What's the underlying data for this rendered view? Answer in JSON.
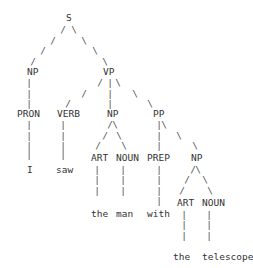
{
  "sentence": [
    "I",
    "saw",
    "the",
    "man",
    "with",
    "the",
    "telescope"
  ],
  "nodes": [
    {
      "id": "S",
      "label": "S",
      "x": 66,
      "y": 18,
      "kind": "phrase"
    },
    {
      "id": "NP1",
      "label": "NP",
      "x": 27,
      "y": 72,
      "kind": "phrase"
    },
    {
      "id": "VP",
      "label": "VP",
      "x": 103,
      "y": 72,
      "kind": "phrase"
    },
    {
      "id": "PRON",
      "label": "PRON",
      "x": 17,
      "y": 114,
      "kind": "pos"
    },
    {
      "id": "VERB",
      "label": "VERB",
      "x": 57,
      "y": 114,
      "kind": "pos"
    },
    {
      "id": "NP2",
      "label": "NP",
      "x": 107,
      "y": 114,
      "kind": "phrase"
    },
    {
      "id": "PP",
      "label": "PP",
      "x": 153,
      "y": 114,
      "kind": "phrase"
    },
    {
      "id": "ART1",
      "label": "ART",
      "x": 91,
      "y": 158,
      "kind": "pos"
    },
    {
      "id": "NOUN1",
      "label": "NOUN",
      "x": 116,
      "y": 158,
      "kind": "pos"
    },
    {
      "id": "PREP",
      "label": "PREP",
      "x": 147,
      "y": 158,
      "kind": "pos"
    },
    {
      "id": "NP3",
      "label": "NP",
      "x": 191,
      "y": 158,
      "kind": "phrase"
    },
    {
      "id": "ART2",
      "label": "ART",
      "x": 177,
      "y": 203,
      "kind": "pos"
    },
    {
      "id": "NOUN2",
      "label": "NOUN",
      "x": 202,
      "y": 203,
      "kind": "pos"
    }
  ],
  "words": [
    {
      "text": "I",
      "x": 27,
      "y": 170
    },
    {
      "text": "saw",
      "x": 56,
      "y": 170
    },
    {
      "text": "the",
      "x": 91,
      "y": 214
    },
    {
      "text": "man",
      "x": 116,
      "y": 214
    },
    {
      "text": "with",
      "x": 147,
      "y": 214
    },
    {
      "text": "the",
      "x": 173,
      "y": 257
    },
    {
      "text": "telescope",
      "x": 202,
      "y": 257
    }
  ],
  "edges": [
    {
      "from": "S",
      "to": "NP1"
    },
    {
      "from": "S",
      "to": "VP"
    },
    {
      "from": "NP1",
      "to": "PRON"
    },
    {
      "from": "PRON",
      "to": "I"
    },
    {
      "from": "VP",
      "to": "VERB"
    },
    {
      "from": "VP",
      "to": "NP2"
    },
    {
      "from": "VP",
      "to": "PP"
    },
    {
      "from": "VERB",
      "to": "saw"
    },
    {
      "from": "NP2",
      "to": "ART1"
    },
    {
      "from": "NP2",
      "to": "NOUN1"
    },
    {
      "from": "ART1",
      "to": "the"
    },
    {
      "from": "NOUN1",
      "to": "man"
    },
    {
      "from": "PP",
      "to": "PREP"
    },
    {
      "from": "PP",
      "to": "NP3"
    },
    {
      "from": "PREP",
      "to": "with"
    },
    {
      "from": "NP3",
      "to": "ART2"
    },
    {
      "from": "NP3",
      "to": "NOUN2"
    },
    {
      "from": "ART2",
      "to": "the"
    },
    {
      "from": "NOUN2",
      "to": "telescope"
    }
  ],
  "branch_glyphs": [
    {
      "c": "/",
      "x": 63,
      "y": 30
    },
    {
      "c": "\\",
      "x": 74,
      "y": 30
    },
    {
      "c": "/",
      "x": 53,
      "y": 41
    },
    {
      "c": "\\",
      "x": 84,
      "y": 41
    },
    {
      "c": "/",
      "x": 43,
      "y": 51
    },
    {
      "c": "\\",
      "x": 95,
      "y": 51
    },
    {
      "c": "/",
      "x": 33,
      "y": 62
    },
    {
      "c": "\\",
      "x": 105,
      "y": 62
    },
    {
      "c": "|",
      "x": 29,
      "y": 83
    },
    {
      "c": "|",
      "x": 29,
      "y": 94
    },
    {
      "c": "|",
      "x": 29,
      "y": 104
    },
    {
      "c": "/",
      "x": 100,
      "y": 83
    },
    {
      "c": "|",
      "x": 110,
      "y": 83
    },
    {
      "c": "\\",
      "x": 118,
      "y": 83
    },
    {
      "c": "/",
      "x": 84,
      "y": 94
    },
    {
      "c": "|",
      "x": 110,
      "y": 94
    },
    {
      "c": "\\",
      "x": 135,
      "y": 94
    },
    {
      "c": "/",
      "x": 68,
      "y": 104
    },
    {
      "c": "|",
      "x": 110,
      "y": 104
    },
    {
      "c": "\\",
      "x": 150,
      "y": 104
    },
    {
      "c": "|",
      "x": 29,
      "y": 125
    },
    {
      "c": "|",
      "x": 29,
      "y": 136
    },
    {
      "c": "|",
      "x": 29,
      "y": 146
    },
    {
      "c": "|",
      "x": 29,
      "y": 155
    },
    {
      "c": "|",
      "x": 63,
      "y": 125
    },
    {
      "c": "|",
      "x": 63,
      "y": 136
    },
    {
      "c": "|",
      "x": 63,
      "y": 146
    },
    {
      "c": "|",
      "x": 63,
      "y": 155
    },
    {
      "c": "/",
      "x": 110,
      "y": 125
    },
    {
      "c": "\\",
      "x": 115,
      "y": 125
    },
    {
      "c": "/",
      "x": 105,
      "y": 136
    },
    {
      "c": "\\",
      "x": 119,
      "y": 136
    },
    {
      "c": "/",
      "x": 98,
      "y": 146
    },
    {
      "c": "\\",
      "x": 124,
      "y": 146
    },
    {
      "c": "|",
      "x": 159,
      "y": 125
    },
    {
      "c": "\\",
      "x": 164,
      "y": 125
    },
    {
      "c": "|",
      "x": 159,
      "y": 136
    },
    {
      "c": "\\",
      "x": 179,
      "y": 136
    },
    {
      "c": "|",
      "x": 159,
      "y": 146
    },
    {
      "c": "\\",
      "x": 195,
      "y": 146
    },
    {
      "c": "|",
      "x": 97,
      "y": 170
    },
    {
      "c": "|",
      "x": 97,
      "y": 180
    },
    {
      "c": "|",
      "x": 97,
      "y": 191
    },
    {
      "c": "|",
      "x": 123,
      "y": 170
    },
    {
      "c": "|",
      "x": 123,
      "y": 180
    },
    {
      "c": "|",
      "x": 123,
      "y": 191
    },
    {
      "c": "|",
      "x": 159,
      "y": 170
    },
    {
      "c": "|",
      "x": 159,
      "y": 180
    },
    {
      "c": "|",
      "x": 159,
      "y": 191
    },
    {
      "c": "|",
      "x": 159,
      "y": 201
    },
    {
      "c": "/",
      "x": 193,
      "y": 170
    },
    {
      "c": "\\",
      "x": 198,
      "y": 170
    },
    {
      "c": "/",
      "x": 187,
      "y": 180
    },
    {
      "c": "\\",
      "x": 205,
      "y": 180
    },
    {
      "c": "/",
      "x": 182,
      "y": 191
    },
    {
      "c": "\\",
      "x": 210,
      "y": 191
    },
    {
      "c": "|",
      "x": 184,
      "y": 215
    },
    {
      "c": "|",
      "x": 184,
      "y": 225
    },
    {
      "c": "|",
      "x": 184,
      "y": 236
    },
    {
      "c": "|",
      "x": 209,
      "y": 215
    },
    {
      "c": "|",
      "x": 209,
      "y": 225
    },
    {
      "c": "|",
      "x": 209,
      "y": 236
    }
  ],
  "colors": {
    "text": "#333333",
    "branch": "#555555",
    "background": "#ffffff"
  }
}
